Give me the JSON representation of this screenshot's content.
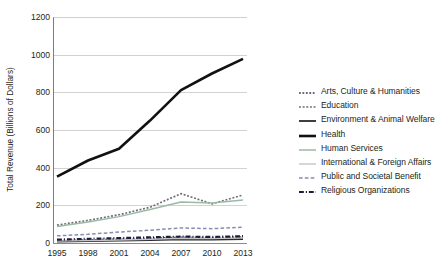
{
  "chart_data": {
    "type": "line",
    "title": "",
    "xlabel": "",
    "ylabel": "Total Revenue (Billions of Dollars)",
    "x": [
      1995,
      1998,
      2001,
      2004,
      2007,
      2010,
      2013
    ],
    "xticklabels": [
      "1995",
      "1998",
      "2001",
      "2004",
      "2007",
      "2010",
      "2013"
    ],
    "yticklabels": [
      "0",
      "200",
      "400",
      "600",
      "800",
      "1000",
      "1200"
    ],
    "ylim": [
      0,
      1200
    ],
    "ytick_step": 200,
    "grid": "horizontal",
    "legend_position": "right",
    "series": [
      {
        "name": "Arts, Culture & Humanities",
        "values": [
          12,
          16,
          20,
          24,
          30,
          28,
          32
        ],
        "color": "#3b3b52",
        "style": "dotted",
        "width": 1.6
      },
      {
        "name": "Education",
        "values": [
          95,
          120,
          150,
          190,
          262,
          208,
          255
        ],
        "color": "#6e6e78",
        "style": "dotted",
        "width": 1.7
      },
      {
        "name": "Environment & Animal Welfare",
        "values": [
          8,
          10,
          13,
          16,
          19,
          18,
          21
        ],
        "color": "#2a2a2a",
        "style": "solid",
        "width": 1.8
      },
      {
        "name": "Health",
        "values": [
          352,
          438,
          500,
          650,
          812,
          900,
          978
        ],
        "color": "#111111",
        "style": "solid",
        "width": 2.6
      },
      {
        "name": "Human Services",
        "values": [
          88,
          112,
          140,
          178,
          218,
          212,
          228
        ],
        "color": "#9bb9a4",
        "style": "solid",
        "width": 1.5
      },
      {
        "name": "International & Foreign Affairs",
        "values": [
          10,
          13,
          16,
          20,
          25,
          24,
          27
        ],
        "color": "#c5c5c5",
        "style": "solid",
        "width": 1.4
      },
      {
        "name": "Public and Societal Benefit",
        "values": [
          38,
          46,
          58,
          68,
          80,
          76,
          84
        ],
        "color": "#8a8ab0",
        "style": "dashed",
        "width": 1.5
      },
      {
        "name": "Religious Organizations",
        "values": [
          18,
          22,
          26,
          30,
          34,
          32,
          36
        ],
        "color": "#1c1c3c",
        "style": "dashdot",
        "width": 2.2
      }
    ]
  }
}
